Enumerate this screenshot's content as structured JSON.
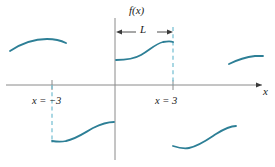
{
  "figure": {
    "labels": {
      "y_axis": "f(x)",
      "x_axis": "x",
      "period": "L",
      "left_boundary": "x = −3",
      "right_boundary": "x = 3"
    },
    "colors": {
      "curve": "#2d7f96",
      "dashed_guide": "#7cc2d4",
      "axis": "#8a8a8a",
      "dimension": "#3a3a3a",
      "background": "#ffffff"
    }
  },
  "chart_data": {
    "type": "line",
    "xlabel": "x",
    "ylabel": "f(x)",
    "grid": false,
    "legend": null,
    "period": 6,
    "period_label": "L",
    "period_span": [
      0,
      3
    ],
    "axis_pixels": {
      "x_axis_y": 85,
      "y_axis_x": 115,
      "y_axis_top": 18,
      "y_axis_bottom": 160,
      "x_axis_left": 6,
      "x_axis_right": 262
    },
    "ticks": [
      {
        "label": "x = −3",
        "x_px": 52
      },
      {
        "label": "x = 3",
        "x_px": 173
      }
    ],
    "dashed_guides": [
      {
        "x_px": 52,
        "y_from_px": 85,
        "y_to_px": 141
      },
      {
        "x_px": 173,
        "y_from_px": 27,
        "y_to_px": 85
      }
    ],
    "dimension_arrow": {
      "label": "L",
      "y_px": 32,
      "x_from_px": 116,
      "x_to_px": 173
    },
    "segments": [
      {
        "name": "upper-left-partial",
        "path": "M 10,51 C 22,43 34,39 47,39 C 55,39 62,41 66,43"
      },
      {
        "name": "upper-main",
        "path": "M 116,60 C 126,60 134,59 141,55 C 150,50 155,44 163,42 C 168,41 171,41 173,42"
      },
      {
        "name": "upper-right-partial",
        "path": "M 229,64 C 237,60 246,57 255,56 C 259,56 261,56 263,56"
      },
      {
        "name": "lower-left-partial",
        "path": "M 52,141 C 58,142 62,142 66,141 C 76,139 84,133 93,128 C 101,124 108,122 114,122"
      },
      {
        "name": "lower-right-partial",
        "path": "M 173,146 C 179,148 184,149 189,148 C 199,146 207,140 216,134 C 224,129 231,126 236,126"
      }
    ]
  }
}
